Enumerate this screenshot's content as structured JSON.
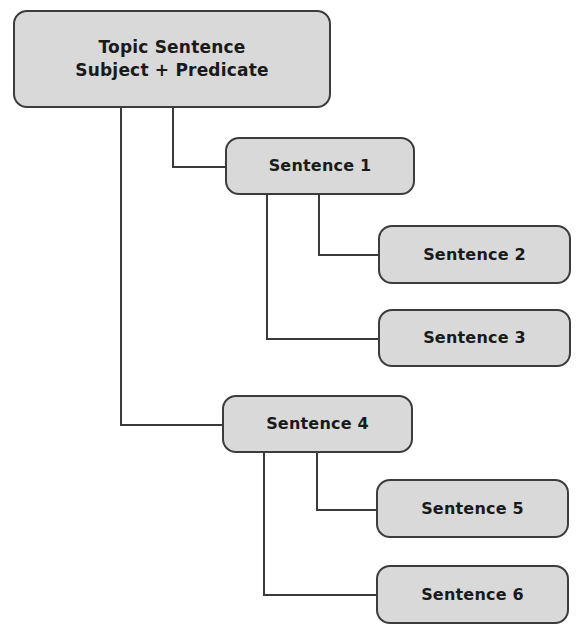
{
  "diagram": {
    "type": "hierarchy-tree",
    "colors": {
      "box_fill": "#d9d9d9",
      "box_border": "#3c3c3c",
      "line": "#3a3a3a",
      "text": "#1a1a1a"
    },
    "root": {
      "line1": "Topic Sentence",
      "line2": "Subject + Predicate"
    },
    "nodes": [
      {
        "id": "s1",
        "label": "Sentence 1",
        "parent": "root"
      },
      {
        "id": "s2",
        "label": "Sentence 2",
        "parent": "s1"
      },
      {
        "id": "s3",
        "label": "Sentence 3",
        "parent": "s1"
      },
      {
        "id": "s4",
        "label": "Sentence 4",
        "parent": "root"
      },
      {
        "id": "s5",
        "label": "Sentence 5",
        "parent": "s4"
      },
      {
        "id": "s6",
        "label": "Sentence 6",
        "parent": "s4"
      }
    ]
  }
}
